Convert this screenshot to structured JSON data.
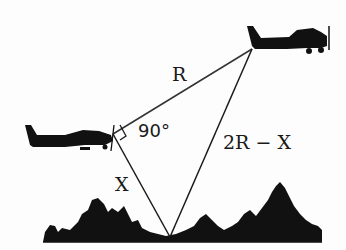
{
  "diagram": {
    "labels": {
      "hypotenuse_top": "R",
      "right_angle": "90°",
      "right_side": "2R − X",
      "left_side": "X"
    },
    "elements": {
      "upper_plane": "small-airplane-silhouette",
      "lower_plane": "small-airplane-silhouette",
      "ground": "tree-line-silhouette"
    },
    "colors": {
      "line": "#1a1a1a",
      "silhouette": "#111111",
      "background": "#fdfdfd"
    }
  }
}
